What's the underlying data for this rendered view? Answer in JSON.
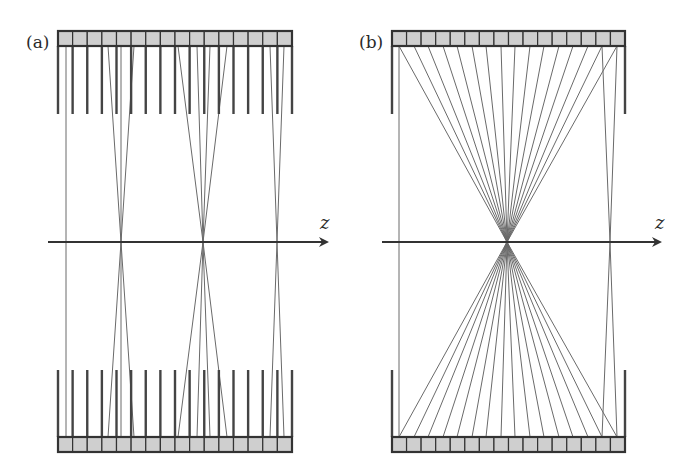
{
  "figure": {
    "colors": {
      "element_fill": "#cfcfcf",
      "element_stroke": "#333333",
      "septa": "#444444",
      "ray": "#6a6a6a",
      "axis": "#333333",
      "background": "#ffffff"
    },
    "axis": {
      "y": 242,
      "label": "z"
    },
    "panels": [
      {
        "id": "a",
        "label": "(a)",
        "label_pos": [
          26,
          34
        ],
        "array_x0": 58,
        "array_x1": 292,
        "element_count": 16,
        "top_array_y": [
          31,
          46
        ],
        "bottom_array_y": [
          437,
          452
        ],
        "septa": "all",
        "septa_top_y": [
          46,
          114
        ],
        "septa_bottom_y": [
          370,
          437
        ],
        "axis_x": [
          48,
          327
        ],
        "axis_label_pos": [
          320,
          214
        ],
        "focal_groups": [
          {
            "focus_x": 66,
            "sources_x": [
              66
            ]
          },
          {
            "focus_x": 121,
            "sources_x": [
              108,
              121,
              134
            ]
          },
          {
            "focus_x": 203,
            "sources_x": [
              178,
              197,
              210,
              227
            ]
          },
          {
            "focus_x": 277,
            "sources_x": [
              270,
              284
            ]
          }
        ]
      },
      {
        "id": "b",
        "label": "(b)",
        "label_pos": [
          359,
          34
        ],
        "array_x0": 392,
        "array_x1": 625,
        "element_count": 16,
        "top_array_y": [
          31,
          46
        ],
        "bottom_array_y": [
          437,
          452
        ],
        "septa": "walls",
        "septa_top_y": [
          46,
          114
        ],
        "septa_bottom_y": [
          370,
          437
        ],
        "axis_x": [
          382,
          660
        ],
        "axis_label_pos": [
          655,
          214
        ],
        "focal_groups": [
          {
            "focus_x": 399,
            "sources_x": [
              399
            ]
          },
          {
            "focus_x": 507,
            "sources_x": [
              399,
              414,
              428,
              443,
              457,
              472,
              486,
              501,
              515,
              530,
              544,
              559,
              573,
              588,
              602,
              617
            ]
          },
          {
            "focus_x": 610,
            "sources_x": [
              602,
              617
            ]
          }
        ]
      }
    ]
  }
}
